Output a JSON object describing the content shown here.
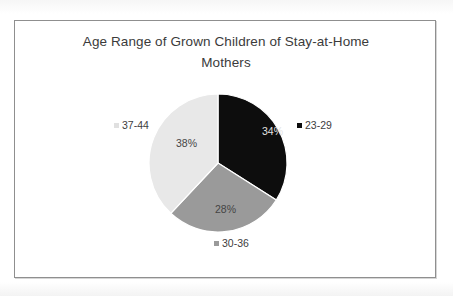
{
  "chart_data": {
    "type": "pie",
    "title": "Age Range of Grown Children of Stay-at-Home\nMothers",
    "title_line_1": "Age Range of Grown Children of Stay-at-Home",
    "title_line_2": "Mothers",
    "categories": [
      "23-29",
      "30-36",
      "37-44"
    ],
    "values": [
      34,
      28,
      38
    ],
    "value_labels": [
      "34%",
      "28%",
      "38%"
    ],
    "unit": "%",
    "colors": [
      "#0d0d0d",
      "#9a9a9a",
      "#e8e8e8"
    ],
    "legend": "none",
    "data_labels": "percentage",
    "category_labels_position": "outside",
    "start_angle_deg": 0,
    "direction": "clockwise",
    "grid": false,
    "xlabel": "",
    "ylabel": ""
  },
  "frame": {
    "border_color": "#8f8f8f",
    "background": "#ffffff"
  }
}
